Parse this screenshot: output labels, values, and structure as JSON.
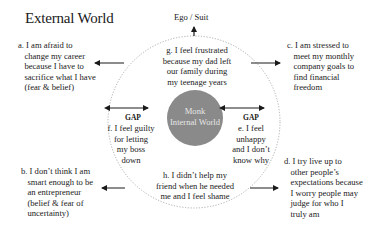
{
  "title": "External World",
  "top_label": "Ego / Suit",
  "center": {
    "line1": "Monk",
    "line2": "Internal World",
    "color": "#8a8a8a"
  },
  "gap_label": "GAP",
  "external_items": {
    "a": "a. I am afraid to\n   change my career\n   because I have to\n   sacrifice what I have\n   (fear & belief)",
    "b": "b. I don’t think I am\n   smart enough to be\n   an entrepreneur\n   (belief & fear of\n   uncertainty)",
    "c": "c. I am stressed to\n   meet my monthly\n   company goals to\n   find financial\n   freedom",
    "d": "d. I try live up to\n   other people’s\n   expectations because\n   I worry people may\n   judge for who I\n   truly am"
  },
  "internal_items": {
    "g": "g. I feel frustrated\nbecause my dad left\nour family during\nmy teenage years",
    "f": "f. I feel guilty\nfor letting\nmy boss\ndown",
    "e": "e. I feel\nunhappy\nand I don’t\nknow why",
    "h": "h. I didn’t help my\nfriend when he needed\nme and I feel shame"
  },
  "colors": {
    "text": "#1a1a1a",
    "circle_dash": "#9a9a9a",
    "disc": "#8a8a8a",
    "arrow": "#1a1a1a"
  }
}
